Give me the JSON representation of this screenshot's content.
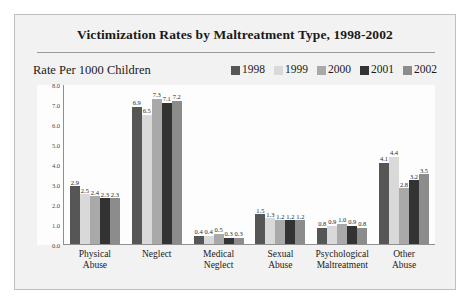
{
  "figure": {
    "title": "Victimization Rates by Maltreatment Type, 1998-2002",
    "axis_caption": "Rate Per 1000 Children"
  },
  "colors": {
    "series_1998": "#565656",
    "series_1999": "#d9d9d9",
    "series_2000": "#a9a9a9",
    "series_2001": "#333333",
    "series_2002": "#8c8c8c",
    "axis": "#8f8f8f",
    "frame": "#bfbfbf",
    "figure_background": "#f2f2f2",
    "plot_background": "#fdfdfd"
  },
  "chart_data": {
    "type": "bar",
    "title": "Victimization Rates by Maltreatment Type, 1998-2002",
    "xlabel": "",
    "ylabel": "Rate Per 1000 Children",
    "ylim": [
      0,
      8
    ],
    "ytick_labels": [
      "8.0",
      "7.0",
      "6.0",
      "5.0",
      "4.0",
      "3.0",
      "2.0",
      "1.0",
      "0.0"
    ],
    "yticks": [
      8,
      7,
      6,
      5,
      4,
      3,
      2,
      1,
      0
    ],
    "grid": false,
    "legend_position": "top-right",
    "categories": [
      {
        "line1": "Physical",
        "line2": "Abuse"
      },
      {
        "line1": "Neglect",
        "line2": ""
      },
      {
        "line1": "Medical",
        "line2": "Neglect"
      },
      {
        "line1": "Sexual",
        "line2": "Abuse"
      },
      {
        "line1": "Psychological",
        "line2": "Maltreatment"
      },
      {
        "line1": "Other",
        "line2": "Abuse"
      }
    ],
    "series": [
      {
        "name": "1998",
        "color": "#565656",
        "values": [
          2.9,
          6.9,
          0.4,
          1.5,
          0.8,
          4.1
        ]
      },
      {
        "name": "1999",
        "color": "#d9d9d9",
        "values": [
          2.5,
          6.5,
          0.4,
          1.3,
          0.9,
          4.4
        ]
      },
      {
        "name": "2000",
        "color": "#a9a9a9",
        "values": [
          2.4,
          7.3,
          0.5,
          1.2,
          1.0,
          2.8
        ]
      },
      {
        "name": "2001",
        "color": "#333333",
        "values": [
          2.3,
          7.1,
          0.3,
          1.2,
          0.9,
          3.2
        ]
      },
      {
        "name": "2002",
        "color": "#8c8c8c",
        "values": [
          2.3,
          7.2,
          0.3,
          1.2,
          0.8,
          3.5
        ]
      }
    ]
  }
}
